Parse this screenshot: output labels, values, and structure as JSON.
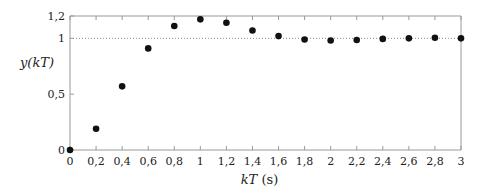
{
  "chart_data": {
    "type": "scatter",
    "title": "",
    "xlabel": "kT (s)",
    "ylabel": "y(kT)",
    "xlim": [
      0,
      3
    ],
    "ylim": [
      0,
      1.2
    ],
    "x_ticks": [
      "0",
      "0,2",
      "0,4",
      "0,6",
      "0,8",
      "1",
      "1,2",
      "1,4",
      "1,6",
      "1,8",
      "2",
      "2,2",
      "2,4",
      "2,6",
      "2,8",
      "3"
    ],
    "y_ticks": [
      "0",
      "0,5",
      "1",
      "1,2"
    ],
    "grid": false,
    "reference_line": {
      "y": 1,
      "style": "dotted"
    },
    "series": [
      {
        "name": "y(kT)",
        "x": [
          0,
          0.2,
          0.4,
          0.6,
          0.8,
          1.0,
          1.2,
          1.4,
          1.6,
          1.8,
          2.0,
          2.2,
          2.4,
          2.6,
          2.8,
          3.0
        ],
        "values": [
          0,
          0.19,
          0.57,
          0.91,
          1.11,
          1.17,
          1.14,
          1.07,
          1.02,
          0.99,
          0.98,
          0.985,
          0.995,
          1.0,
          1.005,
          1.0
        ]
      }
    ]
  },
  "labels": {
    "xlabel_k": "kT",
    "xlabel_unit": "(s)",
    "ylabel": "y(kT)"
  }
}
